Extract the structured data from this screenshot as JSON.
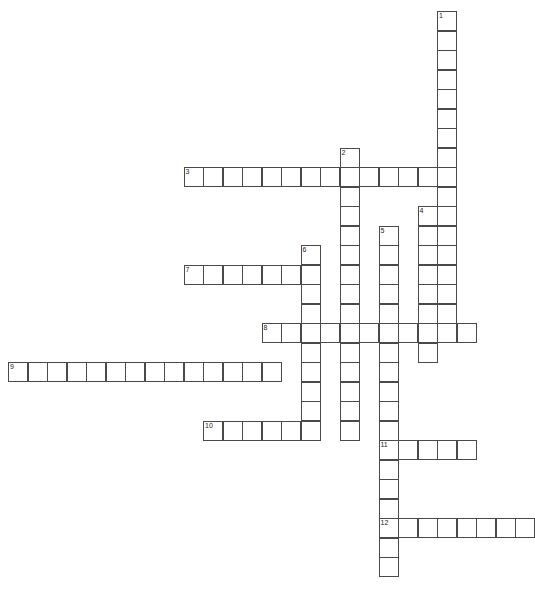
{
  "page": {
    "title_fragment": "",
    "background_color": "#ffffff",
    "cell_border_color": "#4a4a4a",
    "cell_fill_color": "#ffffff",
    "number_color": "#222222",
    "width": 533,
    "height": 591
  },
  "crossword": {
    "cell_size": 19.5,
    "origin_x": 8,
    "origin_y": 11,
    "entries": [
      {
        "number": "1",
        "direction": "down",
        "start_col": 22,
        "start_row": 0,
        "length": 17
      },
      {
        "number": "2",
        "direction": "down",
        "start_col": 17,
        "start_row": 7,
        "length": 15
      },
      {
        "number": "3",
        "direction": "across",
        "start_col": 9,
        "start_row": 8,
        "length": 13
      },
      {
        "number": "4",
        "direction": "down",
        "start_col": 21,
        "start_row": 10,
        "length": 8
      },
      {
        "number": "5",
        "direction": "down",
        "start_col": 19,
        "start_row": 11,
        "length": 18
      },
      {
        "number": "6",
        "direction": "down",
        "start_col": 15,
        "start_row": 12,
        "length": 10
      },
      {
        "number": "7",
        "direction": "across",
        "start_col": 9,
        "start_row": 13,
        "length": 7
      },
      {
        "number": "8",
        "direction": "across",
        "start_col": 13,
        "start_row": 16,
        "length": 11
      },
      {
        "number": "9",
        "direction": "across",
        "start_col": 0,
        "start_row": 18,
        "length": 14
      },
      {
        "number": "10",
        "direction": "across",
        "start_col": 10,
        "start_row": 21,
        "length": 5
      },
      {
        "number": "11",
        "direction": "across",
        "start_col": 19,
        "start_row": 22,
        "length": 5
      },
      {
        "number": "12",
        "direction": "across",
        "start_col": 19,
        "start_row": 26,
        "length": 8
      }
    ],
    "numbered_labels": [
      "1",
      "2",
      "3",
      "4",
      "5",
      "6",
      "7",
      "8",
      "9",
      "10",
      "11",
      "12"
    ]
  }
}
